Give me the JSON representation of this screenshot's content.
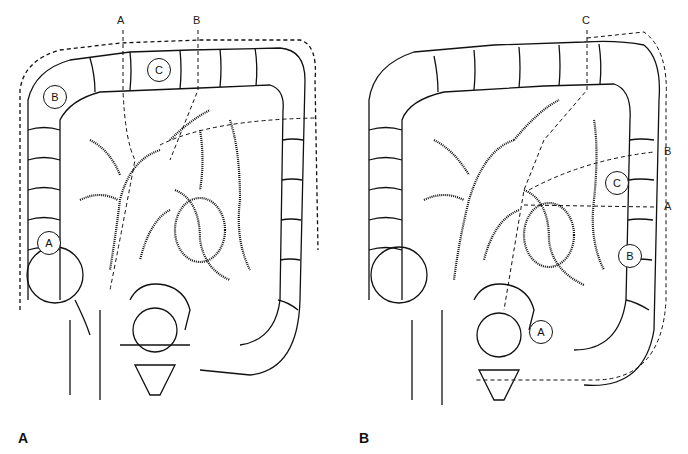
{
  "figure": {
    "panels": [
      {
        "id": "A",
        "panel_label": "A",
        "line_labels": {
          "a": "A",
          "b": "B"
        },
        "segment_labels": {
          "a": "A",
          "b": "B",
          "c": "C"
        }
      },
      {
        "id": "B",
        "panel_label": "B",
        "line_labels": {
          "a": "A",
          "b": "B",
          "c": "C"
        },
        "segment_labels": {
          "a": "A",
          "b": "B",
          "c": "C"
        }
      }
    ],
    "colors": {
      "ink": "#111111",
      "background": "#ffffff"
    }
  }
}
